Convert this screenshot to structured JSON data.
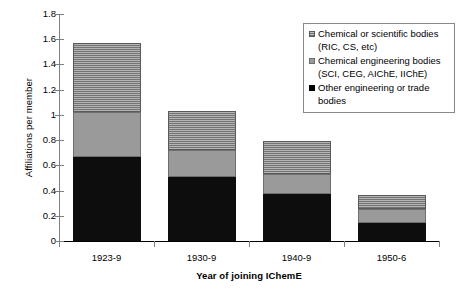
{
  "chart_data": {
    "type": "bar",
    "subtype": "stacked-vertical",
    "title": "",
    "xlabel": "Year of joining IChemE",
    "ylabel": "Affiliations per member",
    "categories": [
      "1923-9",
      "1930-9",
      "1940-9",
      "1950-6"
    ],
    "ylim": [
      0,
      1.8
    ],
    "ytick_labels": [
      "0",
      "0.2",
      "0.4",
      "0.6",
      "0.8",
      "1",
      "1.2",
      "1.4",
      "1.6",
      "1.8"
    ],
    "ytick_values": [
      0,
      0.2,
      0.4,
      0.6,
      0.8,
      1.0,
      1.2,
      1.4,
      1.6,
      1.8
    ],
    "grid": false,
    "legend_position": "top-right",
    "series": [
      {
        "name": "Other engineering or trade bodies",
        "legend_label": "Other engineering or trade\nbodies",
        "swatch": "sw-black",
        "color": "#000000",
        "values": [
          0.67,
          0.51,
          0.37,
          0.145
        ]
      },
      {
        "name": "Chemical engineering bodies (SCI, CEG, AIChE, IIChE)",
        "legend_label": "Chemical engineering bodies\n(SCI, CEG, AIChE, IIChE)",
        "swatch": "sw-gray",
        "color": "#9a9a9a",
        "values": [
          0.35,
          0.21,
          0.16,
          0.105
        ]
      },
      {
        "name": "Chemical or scientific bodies (RIC, CS, etc)",
        "legend_label": "Chemical or scientific bodies\n(RIC, CS, etc)",
        "swatch": "sw-hatch",
        "color": "#8e8e8e",
        "values": [
          0.55,
          0.31,
          0.26,
          0.115
        ]
      }
    ],
    "totals": [
      1.57,
      1.03,
      0.79,
      0.365
    ]
  }
}
